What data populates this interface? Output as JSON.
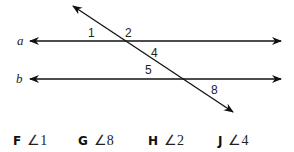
{
  "figure": {
    "lines": [
      {
        "name": "a",
        "label": "a"
      },
      {
        "name": "b",
        "label": "b"
      }
    ],
    "angle_labels": [
      "1",
      "2",
      "4",
      "5",
      "8"
    ]
  },
  "choices": [
    {
      "letter": "F",
      "answer": "∠1"
    },
    {
      "letter": "G",
      "answer": "∠8"
    },
    {
      "letter": "H",
      "answer": "∠2"
    },
    {
      "letter": "J",
      "answer": "∠4"
    }
  ]
}
